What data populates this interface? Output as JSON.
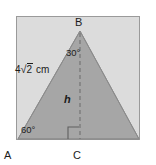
{
  "figure": {
    "kind": "geometry-diagram",
    "colors": {
      "triangle_fill": "#a6a6a6",
      "panel_background": "#dcdcdc",
      "panel_border": "#9a9a9a",
      "stroke": "#8a8a8a",
      "text": "#1b1b1b"
    },
    "panel": {
      "x": 16,
      "y": 16,
      "width": 124,
      "height": 124
    },
    "points": {
      "A": {
        "x": 18,
        "y": 139
      },
      "B": {
        "x": 80,
        "y": 31
      },
      "C": {
        "x": 80,
        "y": 139
      },
      "D": {
        "x": 139,
        "y": 139
      }
    },
    "vertices": [
      {
        "name": "vertex-label-B",
        "text": "B"
      },
      {
        "name": "vertex-label-A",
        "text": "A"
      },
      {
        "name": "vertex-label-C",
        "text": "C"
      }
    ],
    "angles": [
      {
        "name": "angle-at-B",
        "text": "30°",
        "value": 30,
        "unit": "degrees",
        "at": "B"
      },
      {
        "name": "angle-at-A",
        "text": "60°",
        "value": 60,
        "unit": "degrees",
        "at": "A"
      }
    ],
    "right_angle_marker": {
      "at": "C",
      "present": true
    },
    "altitude": {
      "label": "h",
      "from": "B",
      "to": "C",
      "style": "dashed"
    },
    "side_label": {
      "segment": "AB",
      "coefficient": "4",
      "radicand": "2",
      "unit": "cm",
      "full_text": "4√2 cm"
    }
  }
}
